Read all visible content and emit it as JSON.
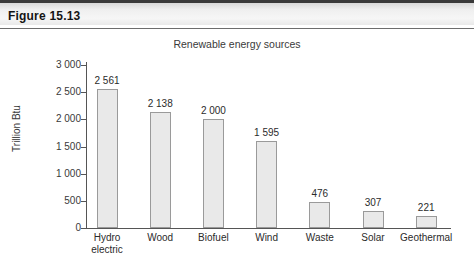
{
  "figure": {
    "header_label": "Figure 15.13"
  },
  "chart_data": {
    "type": "bar",
    "title": "Renewable energy sources",
    "xlabel": "",
    "ylabel": "Trillion Btu",
    "ylim": [
      0,
      3000
    ],
    "ytick_labels": [
      "3 000",
      "2 500",
      "2 000",
      "1 500",
      "1 000",
      "500",
      "0"
    ],
    "ytick_values": [
      3000,
      2500,
      2000,
      1500,
      1000,
      500,
      0
    ],
    "grid": false,
    "legend": "none",
    "categories": [
      "Hydro electric",
      "Wood",
      "Biofuel",
      "Wind",
      "Waste",
      "Solar",
      "Geothermal"
    ],
    "category_lines": [
      [
        "Hydro",
        "electric"
      ],
      [
        "Wood"
      ],
      [
        "Biofuel"
      ],
      [
        "Wind"
      ],
      [
        "Waste"
      ],
      [
        "Solar"
      ],
      [
        "Geothermal"
      ]
    ],
    "values": [
      2561,
      2138,
      2000,
      1595,
      476,
      307,
      221
    ],
    "value_labels": [
      "2 561",
      "2 138",
      "2 000",
      "1 595",
      "476",
      "307",
      "221"
    ],
    "bar_fill": "#e9e9e9",
    "bar_border": "#9a9a9a",
    "axis_color": "#555555"
  }
}
